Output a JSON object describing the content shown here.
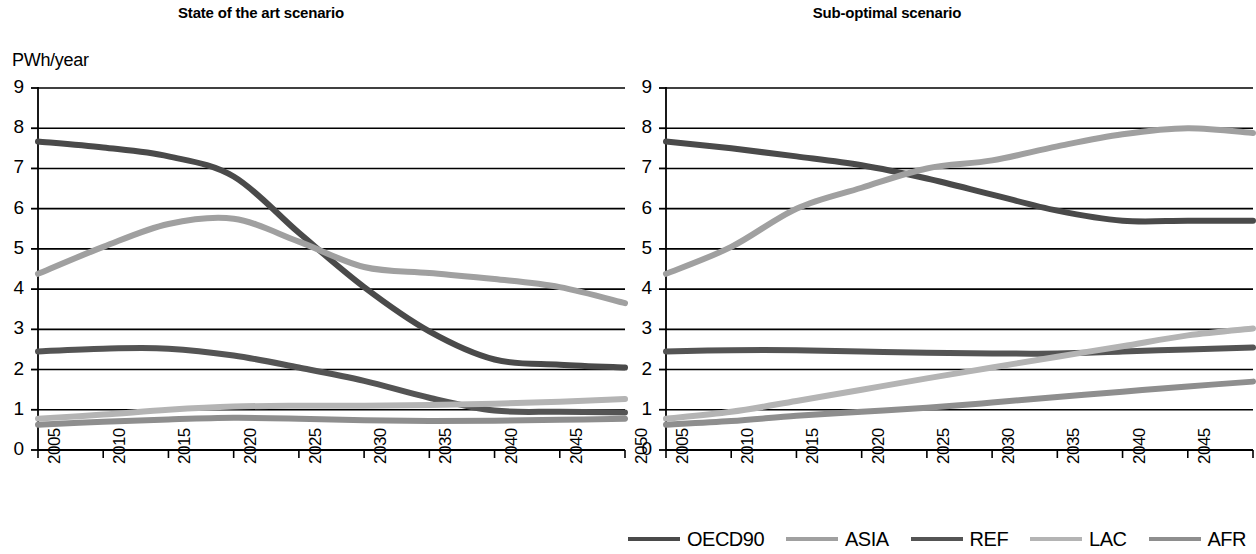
{
  "figure": {
    "y_axis_unit": "PWh/year"
  },
  "legend": {
    "items": [
      {
        "label": "OECD90",
        "color": "#4a4a4a"
      },
      {
        "label": "ASIA",
        "color": "#a0a0a0"
      },
      {
        "label": "REF",
        "color": "#545454"
      },
      {
        "label": "LAC",
        "color": "#b4b4b4"
      },
      {
        "label": "AFR",
        "color": "#8e8e8e"
      }
    ]
  },
  "chart_data": [
    {
      "type": "line",
      "title": "State of the art scenario",
      "xlabel": "",
      "ylabel": "PWh/year",
      "xlim": [
        2005,
        2050
      ],
      "ylim": [
        0,
        9
      ],
      "yticks": [
        0,
        1,
        2,
        3,
        4,
        5,
        6,
        7,
        8,
        9
      ],
      "xticks": [
        2005,
        2010,
        2015,
        2020,
        2025,
        2030,
        2035,
        2040,
        2045,
        2050
      ],
      "grid": "horizontal",
      "legend_position": "below-right-panel",
      "x": [
        2005,
        2010,
        2015,
        2020,
        2025,
        2030,
        2035,
        2040,
        2045,
        2050
      ],
      "series": [
        {
          "name": "OECD90",
          "color": "#4a4a4a",
          "values": [
            7.67,
            7.52,
            7.3,
            6.8,
            5.4,
            4.05,
            2.95,
            2.25,
            2.12,
            2.05
          ]
        },
        {
          "name": "ASIA",
          "color": "#a0a0a0",
          "values": [
            4.38,
            5.05,
            5.62,
            5.75,
            5.18,
            4.55,
            4.4,
            4.25,
            4.05,
            3.65
          ]
        },
        {
          "name": "REF",
          "color": "#545454",
          "values": [
            2.45,
            2.52,
            2.52,
            2.35,
            2.05,
            1.72,
            1.3,
            0.98,
            0.95,
            0.93
          ]
        },
        {
          "name": "LAC",
          "color": "#b4b4b4",
          "values": [
            0.78,
            0.88,
            1.0,
            1.08,
            1.1,
            1.1,
            1.12,
            1.15,
            1.2,
            1.27
          ]
        },
        {
          "name": "AFR",
          "color": "#8e8e8e",
          "values": [
            0.63,
            0.7,
            0.76,
            0.8,
            0.78,
            0.74,
            0.72,
            0.73,
            0.75,
            0.78
          ]
        }
      ]
    },
    {
      "type": "line",
      "title": "Sub-optimal scenario",
      "xlabel": "",
      "ylabel": "PWh/year",
      "xlim": [
        2005,
        2050
      ],
      "ylim": [
        0,
        9
      ],
      "yticks": [
        0,
        1,
        2,
        3,
        4,
        5,
        6,
        7,
        8,
        9
      ],
      "xticks": [
        2005,
        2010,
        2015,
        2020,
        2025,
        2030,
        2035,
        2040,
        2045,
        2050
      ],
      "grid": "horizontal",
      "legend_position": "below",
      "x": [
        2005,
        2010,
        2015,
        2020,
        2025,
        2030,
        2035,
        2040,
        2045,
        2050
      ],
      "series": [
        {
          "name": "OECD90",
          "color": "#4a4a4a",
          "values": [
            7.67,
            7.5,
            7.3,
            7.08,
            6.75,
            6.35,
            5.95,
            5.7,
            5.7,
            5.7
          ]
        },
        {
          "name": "ASIA",
          "color": "#a0a0a0",
          "values": [
            4.38,
            5.05,
            6.0,
            6.52,
            7.0,
            7.2,
            7.55,
            7.85,
            8.0,
            7.88
          ]
        },
        {
          "name": "REF",
          "color": "#545454",
          "values": [
            2.45,
            2.48,
            2.48,
            2.45,
            2.42,
            2.4,
            2.4,
            2.45,
            2.5,
            2.55
          ]
        },
        {
          "name": "LAC",
          "color": "#b4b4b4",
          "values": [
            0.78,
            0.95,
            1.22,
            1.5,
            1.78,
            2.05,
            2.32,
            2.58,
            2.85,
            3.02
          ]
        },
        {
          "name": "AFR",
          "color": "#8e8e8e",
          "values": [
            0.63,
            0.72,
            0.85,
            0.95,
            1.05,
            1.18,
            1.32,
            1.45,
            1.58,
            1.7
          ]
        }
      ]
    }
  ]
}
